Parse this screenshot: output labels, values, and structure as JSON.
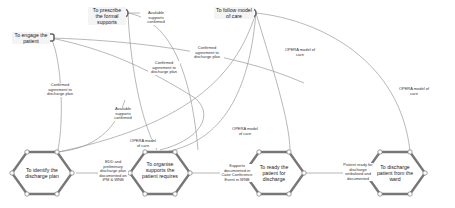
{
  "diagram": {
    "type": "goal-flow",
    "top_goals": [
      {
        "id": "engage",
        "label": "To engage the patient",
        "x": 33,
        "y": 38
      },
      {
        "id": "prescribe",
        "label": "To prescribe the formal supports",
        "x": 99,
        "y": 13
      },
      {
        "id": "follow",
        "label": "To follow model of care",
        "x": 213,
        "y": 13
      }
    ],
    "hexagons": [
      {
        "id": "identify",
        "label": "To identify the discharge plan",
        "cx": 42,
        "cy": 173
      },
      {
        "id": "organise",
        "label": "To organise supports the patient requires",
        "cx": 160,
        "cy": 173
      },
      {
        "id": "ready",
        "label": "To ready the patient for discharge",
        "cx": 274,
        "cy": 173
      },
      {
        "id": "discharge",
        "label": "To discharge patient from the ward",
        "cx": 395,
        "cy": 173
      }
    ],
    "edge_labels": {
      "avail_top": "Available supports confirmed",
      "confirmed_left": "Confirmed agreement to discharge plan",
      "confirmed_mid": "Confirmed agreement to discharge plan",
      "confirmed_right": "Confirmed agreement to discharge plan",
      "avail_left": "Available supports confirmed",
      "opera_left": "OPERA model of care",
      "opera_mid": "OPERA model of care",
      "opera_right1": "OPERA model of care",
      "opera_right2": "OPERA model of care",
      "edd": "EDD and preliminary discharge plan documented on iPM & WNB",
      "supports_doc": "Supports documented in Case Conference Event in WNB",
      "ready_doc": "Patient ready for discharge verbalised and documented"
    },
    "colors": {
      "hex_stroke": "#777777",
      "line": "#999999",
      "node": "#666666"
    }
  }
}
